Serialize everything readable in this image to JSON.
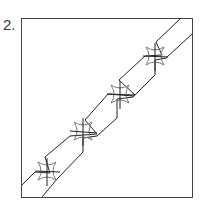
{
  "figure": {
    "label": "2.",
    "colors": {
      "frame": "#444444",
      "lines": "#222222",
      "stars": "#777777"
    },
    "star_count": 4
  }
}
